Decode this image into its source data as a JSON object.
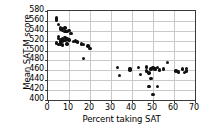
{
  "chart_data": {
    "type": "scatter",
    "title": "",
    "xlabel": "Percent taking SAT",
    "ylabel": "Mean SAT-M score",
    "xlim": [
      0,
      70
    ],
    "ylim": [
      400,
      580
    ],
    "xticks": [
      0,
      10,
      20,
      30,
      40,
      50,
      60,
      70
    ],
    "yticks": [
      400,
      420,
      440,
      460,
      480,
      500,
      520,
      540,
      560,
      580
    ],
    "grid": true,
    "legend": null,
    "marker_color": "#111111",
    "points": [
      {
        "x": 4,
        "y": 566
      },
      {
        "x": 4,
        "y": 562
      },
      {
        "x": 5,
        "y": 553
      },
      {
        "x": 6,
        "y": 546
      },
      {
        "x": 6,
        "y": 543
      },
      {
        "x": 7,
        "y": 545
      },
      {
        "x": 7,
        "y": 540
      },
      {
        "x": 8,
        "y": 546
      },
      {
        "x": 8,
        "y": 538
      },
      {
        "x": 5,
        "y": 529
      },
      {
        "x": 5,
        "y": 524
      },
      {
        "x": 6,
        "y": 521
      },
      {
        "x": 6,
        "y": 517
      },
      {
        "x": 7,
        "y": 523
      },
      {
        "x": 7,
        "y": 519
      },
      {
        "x": 8,
        "y": 526
      },
      {
        "x": 8,
        "y": 520
      },
      {
        "x": 9,
        "y": 538
      },
      {
        "x": 9,
        "y": 523
      },
      {
        "x": 10,
        "y": 540
      },
      {
        "x": 10,
        "y": 521
      },
      {
        "x": 11,
        "y": 534
      },
      {
        "x": 12,
        "y": 518
      },
      {
        "x": 4,
        "y": 515
      },
      {
        "x": 5,
        "y": 512
      },
      {
        "x": 6,
        "y": 513
      },
      {
        "x": 7,
        "y": 511
      },
      {
        "x": 9,
        "y": 513
      },
      {
        "x": 13,
        "y": 519
      },
      {
        "x": 14,
        "y": 517
      },
      {
        "x": 16,
        "y": 513
      },
      {
        "x": 17,
        "y": 512
      },
      {
        "x": 19,
        "y": 509
      },
      {
        "x": 20,
        "y": 504
      },
      {
        "x": 17,
        "y": 484
      },
      {
        "x": 33,
        "y": 466
      },
      {
        "x": 34,
        "y": 450
      },
      {
        "x": 39,
        "y": 464
      },
      {
        "x": 39,
        "y": 461
      },
      {
        "x": 43,
        "y": 466
      },
      {
        "x": 44,
        "y": 452
      },
      {
        "x": 47,
        "y": 467
      },
      {
        "x": 47,
        "y": 459
      },
      {
        "x": 48,
        "y": 455
      },
      {
        "x": 48,
        "y": 427
      },
      {
        "x": 49,
        "y": 463
      },
      {
        "x": 49,
        "y": 444
      },
      {
        "x": 50,
        "y": 466
      },
      {
        "x": 50,
        "y": 411
      },
      {
        "x": 51,
        "y": 464
      },
      {
        "x": 51,
        "y": 462
      },
      {
        "x": 52,
        "y": 466
      },
      {
        "x": 52,
        "y": 427
      },
      {
        "x": 53,
        "y": 461
      },
      {
        "x": 55,
        "y": 463
      },
      {
        "x": 57,
        "y": 476
      },
      {
        "x": 61,
        "y": 459
      },
      {
        "x": 62,
        "y": 457
      },
      {
        "x": 64,
        "y": 463
      },
      {
        "x": 65,
        "y": 456
      },
      {
        "x": 66,
        "y": 464
      },
      {
        "x": 66,
        "y": 459
      }
    ]
  }
}
